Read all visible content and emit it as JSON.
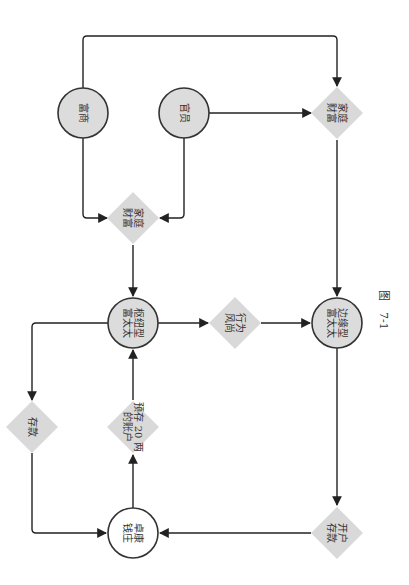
{
  "figure": {
    "caption": "图　7-1",
    "colors": {
      "node_fill": "#dcdcdc",
      "node_stroke": "#333333",
      "diamond_fill": "#d9d9d9",
      "edge": "#222222",
      "bank_fill": "#ffffff"
    }
  },
  "nodes": [
    {
      "id": "fushang",
      "shape": "circle",
      "lines": [
        "富商"
      ]
    },
    {
      "id": "guanyuan",
      "shape": "circle",
      "lines": [
        "官员"
      ]
    },
    {
      "id": "family_wealth_top",
      "shape": "diamond",
      "lines": [
        "家庭",
        "财富"
      ]
    },
    {
      "id": "family_wealth_mid",
      "shape": "diamond",
      "lines": [
        "家庭",
        "财富"
      ]
    },
    {
      "id": "hub_wife",
      "shape": "circle",
      "lines": [
        "枢纽型",
        "富太太"
      ]
    },
    {
      "id": "behavior",
      "shape": "diamond",
      "lines": [
        "行为",
        "风尚"
      ]
    },
    {
      "id": "edge_wife",
      "shape": "circle",
      "lines": [
        "边缘型",
        "富太太"
      ]
    },
    {
      "id": "deposit",
      "shape": "diamond",
      "lines": [
        "存款"
      ]
    },
    {
      "id": "prepaid_account",
      "shape": "diamond",
      "lines": [
        "预存 20 两",
        "的账户"
      ]
    },
    {
      "id": "open_account",
      "shape": "diamond",
      "lines": [
        "开户",
        "存款"
      ]
    },
    {
      "id": "bank",
      "shape": "circle",
      "lines": [
        "卓康",
        "钱庄"
      ]
    }
  ],
  "edges": [
    {
      "from": "fushang",
      "to": "family_wealth_top"
    },
    {
      "from": "fushang",
      "to": "family_wealth_mid"
    },
    {
      "from": "guanyuan",
      "to": "family_wealth_top"
    },
    {
      "from": "guanyuan",
      "to": "family_wealth_mid"
    },
    {
      "from": "family_wealth_top",
      "to": "edge_wife"
    },
    {
      "from": "family_wealth_mid",
      "to": "hub_wife"
    },
    {
      "from": "hub_wife",
      "to": "behavior"
    },
    {
      "from": "behavior",
      "to": "edge_wife"
    },
    {
      "from": "hub_wife",
      "to": "deposit"
    },
    {
      "from": "deposit",
      "to": "bank"
    },
    {
      "from": "bank",
      "to": "prepaid_account"
    },
    {
      "from": "prepaid_account",
      "to": "hub_wife"
    },
    {
      "from": "edge_wife",
      "to": "open_account"
    },
    {
      "from": "open_account",
      "to": "bank"
    }
  ]
}
